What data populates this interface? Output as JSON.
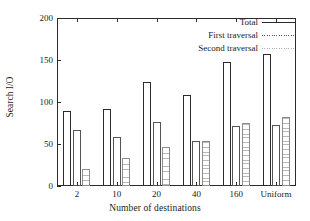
{
  "chart_data": {
    "type": "bar",
    "title": "",
    "xlabel": "Number of destinations",
    "ylabel": "Search I/O",
    "categories": [
      "2",
      "10",
      "20",
      "40",
      "160",
      "Uniform"
    ],
    "series": [
      {
        "name": "Total",
        "values": [
          89,
          92,
          124,
          108,
          148,
          157
        ]
      },
      {
        "name": "First traversal",
        "values": [
          67,
          58,
          76,
          54,
          71,
          73
        ]
      },
      {
        "name": "Second traversal",
        "values": [
          20,
          33,
          46,
          53,
          75,
          82
        ]
      }
    ],
    "ylim": [
      0,
      200
    ],
    "yticks": [
      0,
      50,
      100,
      150,
      200
    ],
    "ytick_labels": [
      "0",
      "50",
      "100",
      "150",
      "200"
    ],
    "grid": false,
    "legend_position": "top-right",
    "colors": {
      "axis": "#2b2b2b",
      "total": "#2b2b2b",
      "first_traversal": "#6d6d6d",
      "second_traversal": "#b8b8b8"
    }
  }
}
